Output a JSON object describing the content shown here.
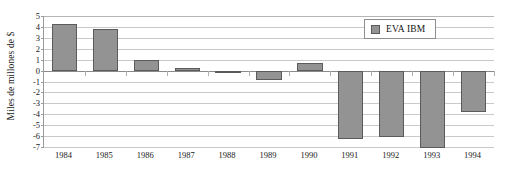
{
  "chart_data": {
    "type": "bar",
    "title": "",
    "subtitle": "",
    "xlabel": "",
    "ylabel": "Miles de millones de $",
    "categories": [
      "1984",
      "1985",
      "1986",
      "1987",
      "1988",
      "1989",
      "1990",
      "1991",
      "1992",
      "1993",
      "1994"
    ],
    "values": [
      4.3,
      3.85,
      1.0,
      0.25,
      -0.15,
      -0.85,
      0.65,
      -6.3,
      -6.1,
      -7.1,
      -3.8
    ],
    "series": [
      {
        "name": "EVA IBM",
        "values": [
          4.3,
          3.85,
          1.0,
          0.25,
          -0.15,
          -0.85,
          0.65,
          -6.3,
          -6.1,
          -7.1,
          -3.8
        ]
      }
    ],
    "ylim": [
      -7,
      5
    ],
    "yticks": [
      5,
      4,
      3,
      2,
      1,
      0,
      -1,
      -2,
      -3,
      -4,
      -5,
      -6,
      -7
    ],
    "ytick_labels": [
      "5",
      "4",
      "3",
      "2",
      "1",
      "0",
      "-1",
      "-2",
      "-3",
      "-4",
      "-5",
      "-6",
      "-7"
    ],
    "grid": true,
    "legend_position": "top-right",
    "bar_color": "#939393",
    "bar_border_color": "#5b5b5b",
    "grid_color": "#c9c9c9",
    "background_color": "#ffffff"
  },
  "legend": {
    "entries": [
      {
        "label": "EVA IBM",
        "color": "#939393"
      }
    ]
  }
}
